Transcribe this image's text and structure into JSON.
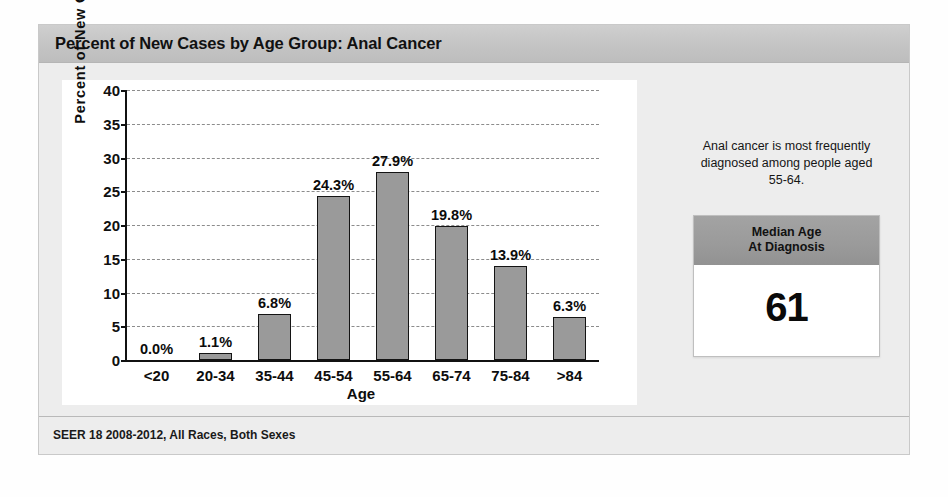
{
  "card": {
    "title": "Percent of New Cases by Age Group: Anal Cancer",
    "footer": "SEER 18 2008-2012, All Races, Both Sexes"
  },
  "side": {
    "note": "Anal cancer is most frequently diagnosed among people aged 55-64.",
    "median_box": {
      "header_line1": "Median Age",
      "header_line2": "At Diagnosis",
      "value": "61"
    }
  },
  "colors": {
    "bar_fill": "#9a9a9a",
    "bar_border": "#141414",
    "header_band": "#c4c4c4",
    "median_header": "#9a9a9a",
    "panel_bg": "#ededed",
    "plot_bg": "#ffffff"
  },
  "chart_data": {
    "type": "bar",
    "title": "Percent of New Cases by Age Group: Anal Cancer",
    "xlabel": "Age",
    "ylabel": "Percent of New Cases",
    "categories": [
      "<20",
      "20-34",
      "35-44",
      "45-54",
      "55-64",
      "65-74",
      "75-84",
      ">84"
    ],
    "values": [
      0.0,
      1.1,
      6.8,
      24.3,
      27.9,
      19.8,
      13.9,
      6.3
    ],
    "data_labels": [
      "0.0%",
      "1.1%",
      "6.8%",
      "24.3%",
      "27.9%",
      "19.8%",
      "13.9%",
      "6.3%"
    ],
    "ylim": [
      0,
      40
    ],
    "yticks": [
      0,
      5,
      10,
      15,
      20,
      25,
      30,
      35,
      40
    ],
    "ytick_labels": [
      "0",
      "5",
      "10",
      "15",
      "20",
      "25",
      "30",
      "35",
      "40"
    ],
    "grid": true,
    "grid_style": "dashed-horizontal",
    "legend": null,
    "annotations": [
      "Anal cancer is most frequently diagnosed among people aged 55-64."
    ]
  }
}
